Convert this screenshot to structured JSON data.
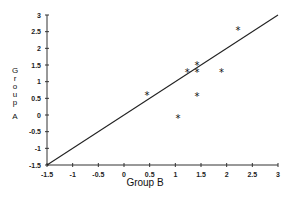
{
  "chart_data": {
    "type": "scatter",
    "title": "",
    "xlabel": "Group B",
    "ylabel": "Group A",
    "xlim": [
      -1.5,
      3
    ],
    "ylim": [
      -1.5,
      3
    ],
    "x_ticks": [
      "-1.5",
      "-1",
      "-0.5",
      "0",
      "0.5",
      "1",
      "1.5",
      "2",
      "2.5",
      "3"
    ],
    "y_ticks": [
      "3",
      "2.5",
      "2",
      "1.5",
      "1",
      "0.5",
      "0",
      "-0.5",
      "-1",
      "-1.5"
    ],
    "grid": false,
    "legend": null,
    "marker": "*",
    "reference_line": {
      "label": "y = x",
      "from": [
        -1.5,
        -1.5
      ],
      "to": [
        3,
        3
      ]
    },
    "series": [
      {
        "name": "observations",
        "points": [
          {
            "x": 0.45,
            "y": 0.6
          },
          {
            "x": 1.05,
            "y": -0.1
          },
          {
            "x": 1.23,
            "y": 1.3
          },
          {
            "x": 1.42,
            "y": 1.5
          },
          {
            "x": 1.42,
            "y": 1.3
          },
          {
            "x": 1.42,
            "y": 0.57
          },
          {
            "x": 1.9,
            "y": 1.3
          },
          {
            "x": 2.22,
            "y": 2.55
          }
        ]
      }
    ]
  },
  "ylabel_chars": [
    "G",
    "r",
    "o",
    "u",
    "p",
    "",
    "A"
  ]
}
